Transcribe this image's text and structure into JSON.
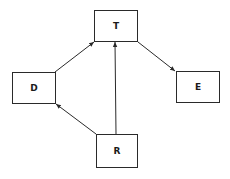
{
  "diagram": {
    "type": "directed-graph",
    "nodes": [
      {
        "id": "T",
        "label": "T"
      },
      {
        "id": "D",
        "label": "D"
      },
      {
        "id": "E",
        "label": "E"
      },
      {
        "id": "R",
        "label": "R"
      }
    ],
    "edges": [
      {
        "from": "D",
        "to": "T"
      },
      {
        "from": "T",
        "to": "E"
      },
      {
        "from": "R",
        "to": "D"
      },
      {
        "from": "R",
        "to": "T"
      }
    ],
    "colors": {
      "stroke": "#2a2a2a",
      "background": "#ffffff",
      "text": "#1a1a1a"
    }
  }
}
